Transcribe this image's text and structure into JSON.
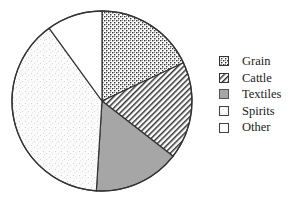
{
  "chart_data": {
    "type": "pie",
    "title": "",
    "categories": [
      "Grain",
      "Cattle",
      "Textiles",
      "Spirits",
      "Other"
    ],
    "values": [
      18,
      17.5,
      15.5,
      39,
      10
    ],
    "unit": "percent",
    "start_angle": "12 o'clock",
    "direction": "clockwise",
    "legend": {
      "position": "right",
      "entries": [
        {
          "label": "Grain",
          "pattern": "crosshatch-dots"
        },
        {
          "label": "Cattle",
          "pattern": "diagonal-lines"
        },
        {
          "label": "Textiles",
          "pattern": "solid-gray"
        },
        {
          "label": "Spirits",
          "pattern": "fine-stipple"
        },
        {
          "label": "Other",
          "pattern": "blank"
        }
      ]
    },
    "colors": {
      "outline": "#333333",
      "textiles_fill": "#a6a6a6",
      "background": "#ffffff"
    }
  }
}
